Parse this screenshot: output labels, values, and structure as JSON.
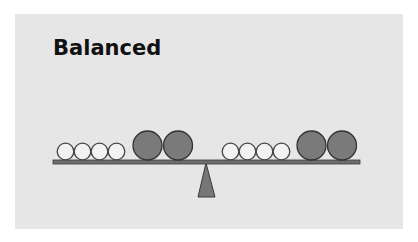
{
  "title": "Balanced",
  "colors": {
    "panel": "#e6e6e6",
    "beam": "#6e6e6e",
    "beam_stroke": "#3a3a3a",
    "small_ball_fill": "#f2f2f2",
    "small_ball_stroke": "#444444",
    "large_ball_fill": "#7a7a7a",
    "large_ball_stroke": "#333333",
    "fulcrum": "#777777"
  },
  "scale": {
    "left_pan": {
      "small_balls": 4,
      "large_balls": 2
    },
    "right_pan": {
      "small_balls": 4,
      "large_balls": 2
    },
    "state": "balanced"
  }
}
